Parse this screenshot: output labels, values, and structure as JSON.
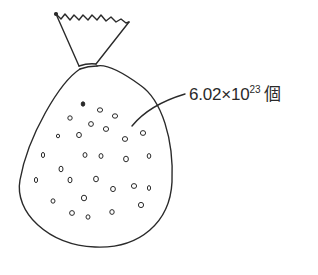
{
  "diagram": {
    "label": {
      "mantissa": "6.02",
      "times": "×",
      "base": "10",
      "exponent": "23",
      "unit": "個"
    },
    "colors": {
      "stroke": "#2a2a2a",
      "background": "#ffffff"
    }
  }
}
